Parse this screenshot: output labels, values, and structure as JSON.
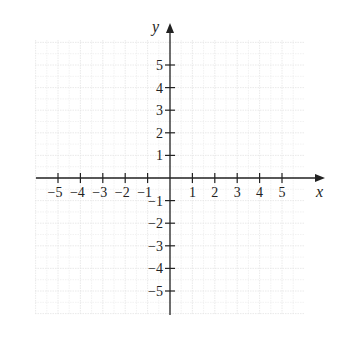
{
  "chart_data": {
    "type": "scatter",
    "title": "",
    "xlabel": "x",
    "ylabel": "y",
    "xlim": [
      -6,
      6.5
    ],
    "ylim": [
      -6,
      6.5
    ],
    "grid": true,
    "x_ticks": [
      -5,
      -4,
      -3,
      -2,
      -1,
      1,
      2,
      3,
      4,
      5
    ],
    "y_ticks": [
      -5,
      -4,
      -3,
      -2,
      -1,
      1,
      2,
      3,
      4,
      5
    ],
    "x_tick_labels": [
      "−5",
      "−4",
      "−3",
      "−2",
      "−1",
      "1",
      "2",
      "3",
      "4",
      "5"
    ],
    "y_tick_labels": [
      "−5",
      "−4",
      "−3",
      "−2",
      "−1",
      "1",
      "2",
      "3",
      "4",
      "5"
    ],
    "series": [],
    "legend": null
  },
  "axes": {
    "x_label": "x",
    "y_label": "y",
    "colors": {
      "axis": "#222222",
      "grid": "#e4e4e4",
      "background": "#ffffff"
    }
  }
}
